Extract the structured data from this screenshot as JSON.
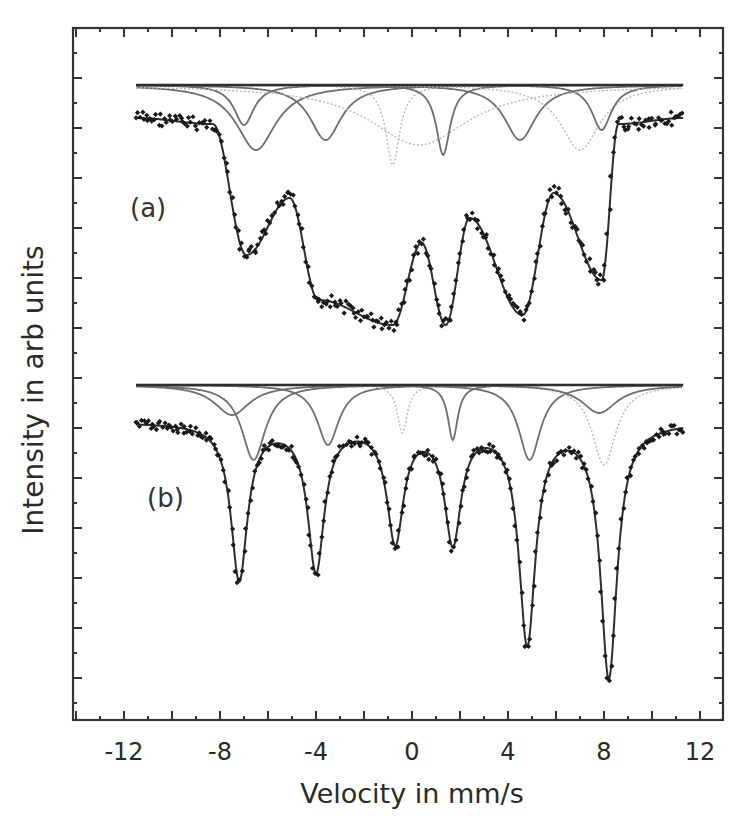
{
  "chart_data": {
    "type": "scatter",
    "title": "",
    "xlabel": "Velocity in mm/s",
    "ylabel": "Intensity in arb units",
    "xlim": [
      -13.5,
      13.5
    ],
    "xticks": [
      -12,
      -8,
      -4,
      0,
      4,
      8,
      12
    ],
    "xtick_labels": [
      "-12",
      "-8",
      "-4",
      "0",
      "4",
      "8",
      "12"
    ],
    "yticks_labeled": false,
    "grid": false,
    "legend": null,
    "panels": [
      {
        "label": "(a)",
        "description": "Broad sextet(s) with multiple fitted sub-spectra (thin grey fit components drawn below baseline)",
        "baseline_fit_y_px": 85,
        "data_baseline_y_px": 118,
        "dips": [
          {
            "velocity": -6.9,
            "depth_px": 255
          },
          {
            "velocity": -3.9,
            "depth_px": 300
          },
          {
            "velocity": -0.8,
            "depth_px": 325
          },
          {
            "velocity": 1.4,
            "depth_px": 325
          },
          {
            "velocity": 4.6,
            "depth_px": 315
          },
          {
            "velocity": 7.9,
            "depth_px": 280
          }
        ],
        "humps": [
          {
            "velocity": -5.1,
            "y_px": 198
          },
          {
            "velocity": 0.4,
            "y_px": 243
          },
          {
            "velocity": 2.4,
            "y_px": 218
          },
          {
            "velocity": 5.9,
            "y_px": 193
          }
        ],
        "wing_edges": [
          -8.3,
          8.6
        ],
        "components": [
          {
            "center": -6.5,
            "width": 1.0,
            "depth": 65
          },
          {
            "center": -3.6,
            "width": 0.8,
            "depth": 55
          },
          {
            "center": -0.8,
            "width": 0.35,
            "depth": 80
          },
          {
            "center": 1.3,
            "width": 0.35,
            "depth": 70
          },
          {
            "center": 4.5,
            "width": 0.8,
            "depth": 55
          },
          {
            "center": 7.0,
            "width": 1.0,
            "depth": 65
          },
          {
            "center": -7.0,
            "width": 0.5,
            "depth": 40
          },
          {
            "center": 7.9,
            "width": 0.5,
            "depth": 45
          },
          {
            "center": 0.3,
            "width": 2.5,
            "depth": 60
          }
        ]
      },
      {
        "label": "(b)",
        "description": "Sharp magnetic sextet with fitted sub-spectra",
        "baseline_fit_y_px": 385,
        "data_baseline_y_px": 422,
        "dips": [
          {
            "velocity": -7.2,
            "depth_px": 578
          },
          {
            "velocity": -4.0,
            "depth_px": 568
          },
          {
            "velocity": -0.7,
            "depth_px": 538
          },
          {
            "velocity": 1.7,
            "depth_px": 538
          },
          {
            "velocity": 4.8,
            "depth_px": 640
          },
          {
            "velocity": 8.2,
            "depth_px": 675
          }
        ],
        "components": [
          {
            "center": -6.6,
            "width": 0.6,
            "depth": 75
          },
          {
            "center": -3.5,
            "width": 0.55,
            "depth": 60
          },
          {
            "center": -0.4,
            "width": 0.25,
            "depth": 48
          },
          {
            "center": 1.7,
            "width": 0.25,
            "depth": 55
          },
          {
            "center": 4.9,
            "width": 0.55,
            "depth": 75
          },
          {
            "center": 8.0,
            "width": 0.6,
            "depth": 80
          },
          {
            "center": -7.5,
            "width": 0.9,
            "depth": 30
          },
          {
            "center": 7.8,
            "width": 0.9,
            "depth": 28
          }
        ]
      }
    ]
  },
  "axes": {
    "xlabel": "Velocity in mm/s",
    "ylabel": "Intensity in arb units",
    "xtick_labels": [
      "-12",
      "-8",
      "-4",
      "0",
      "4",
      "8",
      "12"
    ]
  },
  "panels": {
    "a_label": "(a)",
    "b_label": "(b)"
  },
  "colors": {
    "axis": "#333333",
    "data_points": "#1a1a1a",
    "fit_total": "#2e2e2e",
    "fit_component_dark": "#6e6e6e",
    "fit_component_light": "#b8b8b8"
  }
}
